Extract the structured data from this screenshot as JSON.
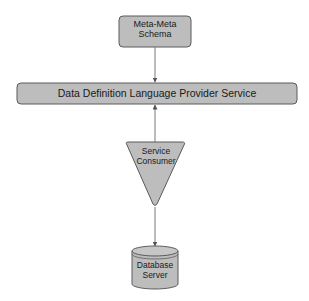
{
  "diagram": {
    "nodes": {
      "meta_schema": {
        "line1": "Meta-Meta",
        "line2": "Schema",
        "shape": "rounded-rectangle"
      },
      "ddl_provider": {
        "label": "Data Definition Language Provider Service",
        "shape": "rounded-rectangle"
      },
      "service_consumer": {
        "line1": "Service",
        "line2": "Consumer",
        "shape": "inverted-triangle"
      },
      "database_server": {
        "line1": "Database",
        "line2": "Server",
        "shape": "cylinder"
      }
    },
    "edges": [
      {
        "from": "Meta-Meta Schema",
        "to": "Data Definition Language Provider Service"
      },
      {
        "from": "Service Consumer",
        "to": "Data Definition Language Provider Service"
      },
      {
        "from": "Service Consumer",
        "to": "Database Server"
      }
    ],
    "colors": {
      "fill": "#bdbdbd",
      "stroke": "#5a5a5a",
      "line": "#7a7a7a",
      "text": "#1a1a1a",
      "background": "#ffffff"
    }
  }
}
